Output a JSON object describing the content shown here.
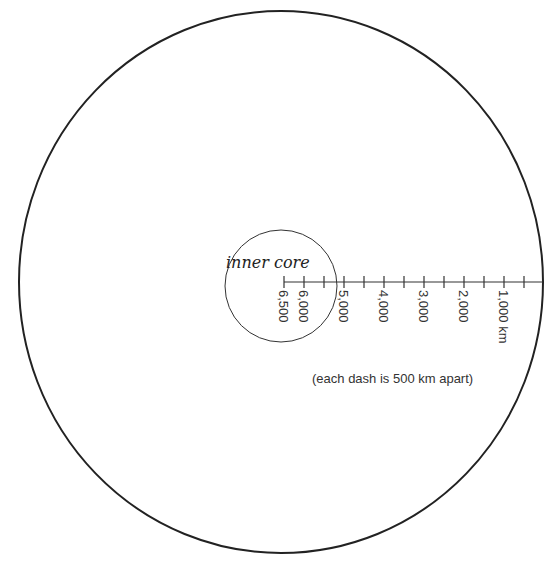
{
  "diagram": {
    "outer_circle": {
      "cx": 281,
      "cy": 282,
      "rx": 262,
      "ry": 271,
      "stroke": "#222222"
    },
    "inner_core": {
      "label": "inner core",
      "cx": 281,
      "cy": 286,
      "r": 56,
      "stroke": "#333333"
    },
    "scale": {
      "axis_y": 282,
      "x_start": 284,
      "x_end": 543,
      "tick_spacing_km": 500,
      "ticks_x": [
        284,
        304,
        324,
        344,
        364,
        384,
        404,
        424,
        444,
        464,
        484,
        504,
        524
      ],
      "labels": [
        {
          "text": "6,500",
          "x": 284
        },
        {
          "text": "6,000",
          "x": 304
        },
        {
          "text": "5,000",
          "x": 344
        },
        {
          "text": "4,000",
          "x": 384
        },
        {
          "text": "3,000",
          "x": 424
        },
        {
          "text": "2,000",
          "x": 464
        },
        {
          "text": "1,000 km",
          "x": 504
        }
      ]
    },
    "note": "(each dash is 500 km apart)"
  }
}
